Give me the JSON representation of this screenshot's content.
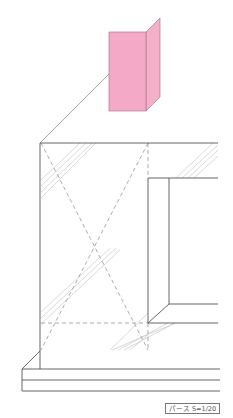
{
  "diagram": {
    "type": "perspective-drawing",
    "scale_label": "パース S=1/20",
    "highlight": {
      "name": "corner-bead-detail",
      "color": "#f4a9c6",
      "edge_color": "#b07a90"
    },
    "colors": {
      "line": "#555555",
      "hatch": "#c8c8c8",
      "dashed": "#888888"
    }
  }
}
